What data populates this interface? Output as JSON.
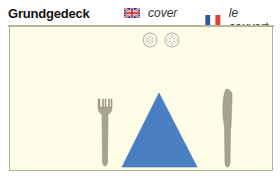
{
  "header": {
    "title": "Grundgedeck",
    "languages": [
      {
        "flag": "uk-flag-icon",
        "label": "cover"
      },
      {
        "flag": "france-flag-icon",
        "label": "le couvert"
      }
    ]
  },
  "illustration": {
    "items": [
      "salt-shaker-icon",
      "pepper-shaker-icon",
      "fork-icon",
      "napkin-icon",
      "knife-icon"
    ],
    "colors": {
      "mat": "#fefee8",
      "napkin": "#4a7fc4",
      "cutlery": "#a59e8e",
      "border": "#b3b09c"
    }
  }
}
